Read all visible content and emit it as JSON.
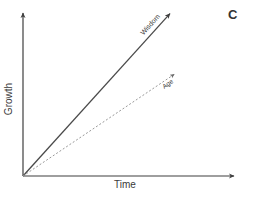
{
  "panel_label": "C",
  "colors": {
    "axis": "#3f3f3f",
    "wisdom_line": "#4a4a4a",
    "age_line": "#999999",
    "text": "#3a3a3a",
    "background": "#ffffff"
  },
  "chart_data": {
    "type": "line",
    "title": "",
    "xlabel": "Time",
    "ylabel": "Growth",
    "axes_numeric": false,
    "grid": false,
    "legend_position": "inline-on-line",
    "series": [
      {
        "name": "Wisdom",
        "style": "solid",
        "x": [
          0,
          0.69
        ],
        "y": [
          0,
          0.99
        ]
      },
      {
        "name": "Age",
        "style": "dotted",
        "x": [
          0,
          0.71
        ],
        "y": [
          0,
          0.62
        ]
      }
    ]
  }
}
